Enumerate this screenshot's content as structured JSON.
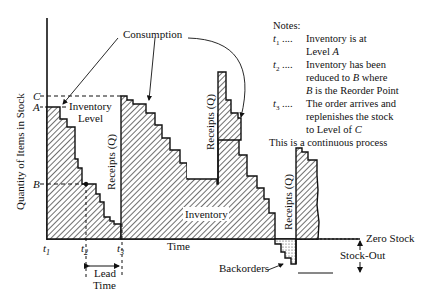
{
  "diagram": {
    "y_axis_label": "Quantity of Items in Stock",
    "x_axis_label": "Time",
    "levels": {
      "C": "C",
      "A": "A",
      "B": "B"
    },
    "time_marks": [
      "t1",
      "t2",
      "t3"
    ],
    "time_mark_labels": [
      {
        "base": "t",
        "sub": "1"
      },
      {
        "base": "t",
        "sub": "2"
      },
      {
        "base": "t",
        "sub": "3"
      }
    ],
    "labels": {
      "consumption": "Consumption",
      "inventory_level_1": "Inventory",
      "inventory_level_2": "Level",
      "receipts": "Receipts (Q)",
      "inventory": "Inventory",
      "lead_time_1": "Lead",
      "lead_time_2": "Time",
      "backorders": "Backorders",
      "zero_stock": "Zero Stock",
      "stock_out": "Stock-Out"
    },
    "notes": {
      "title": "Notes:",
      "items": [
        {
          "mark": "t1",
          "dots": "....",
          "lines": [
            "Inventory is at",
            "Level A"
          ]
        },
        {
          "mark": "t2",
          "dots": "....",
          "lines": [
            "Inventory has been",
            "reduced to B where",
            "B is the Reorder Point"
          ]
        },
        {
          "mark": "t3",
          "dots": "....",
          "lines": [
            "The order arrives and",
            "replenishes the stock",
            "to Level of C"
          ]
        }
      ],
      "footer": "This is a continuous process"
    }
  }
}
